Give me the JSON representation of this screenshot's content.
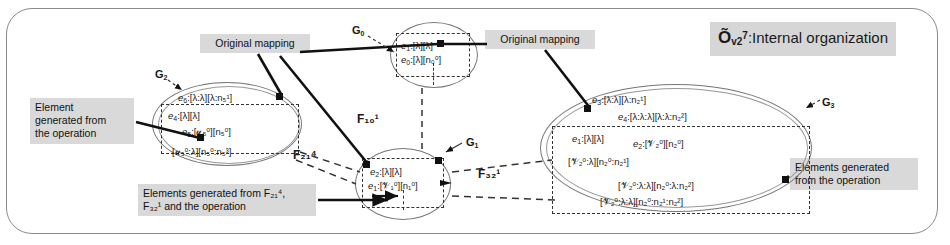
{
  "title": {
    "base": "Õ",
    "sub": "v2",
    "sup": "7",
    "suffix": ":Internal organization"
  },
  "callouts": {
    "original_mapping_left": "Original mapping",
    "original_mapping_right": "Original mapping",
    "element_generated_left": "Element\ngenerated from\nthe operation",
    "elements_generated_bottom": "Elements generated from F₂₁⁴,\nF₃₂¹ and the operation",
    "elements_generated_right": "Elements generated\nfrom the operation"
  },
  "groups": {
    "g0": {
      "label": "G",
      "label_sub": "0",
      "rows": [
        {
          "name": "e",
          "nsub": "1",
          "body": "[λ][λ]"
        },
        {
          "name": "e",
          "nsub": "0",
          "body": "[λ][n₀⁰]"
        }
      ]
    },
    "g1": {
      "label": "G",
      "label_sub": "1",
      "rows": [
        {
          "name": "e",
          "nsub": "2",
          "body": "[λ][λ]"
        },
        {
          "name": "e",
          "nsub": "1",
          "body": "[𝒱₁⁰][n₁⁰]"
        }
      ]
    },
    "g2": {
      "label": "G",
      "label_sub": "2",
      "rows": [
        {
          "name": "e",
          "nsub": "6",
          "body": "[λ:λ][λ:n₅¹]"
        },
        {
          "name": "e",
          "nsub": "4",
          "body": "[λ][λ]"
        },
        {
          "name": "e",
          "nsub": "5",
          "body": "[𝓊₅⁰][n₅⁰]"
        },
        {
          "name": "",
          "nsub": "",
          "body": "[𝓊₅⁰:λ][n₅⁰:n₅³]"
        }
      ]
    },
    "g3": {
      "label": "G",
      "label_sub": "3",
      "rows": [
        {
          "name": "e",
          "nsub": "3",
          "body": "[λ:λ][λ:n₂¹]"
        },
        {
          "name": "e",
          "nsub": "4",
          "body": "[λ:λ:λ][λ:λ:n₂²]"
        },
        {
          "name": "e",
          "nsub": "1",
          "body": "[λ][λ]"
        },
        {
          "name": "e",
          "nsub": "2",
          "body": "[𝒱₂⁰][n₂⁰]"
        },
        {
          "name": "",
          "nsub": "",
          "body": "[𝒱₂⁰:λ][n₂⁰:n₂¹]"
        },
        {
          "name": "",
          "nsub": "",
          "body": "[𝒱₂⁰:λ:λ][n₂⁰:λ:n₂²]"
        },
        {
          "name": "",
          "nsub": "",
          "body": "[𝒱₂⁰:λ:λ][n₂⁰:n₂¹:n₂²]"
        }
      ]
    }
  },
  "mappings": {
    "f10": "F₁₀¹",
    "f21": "F₂₁⁴",
    "f32": "F₃₂¹"
  }
}
